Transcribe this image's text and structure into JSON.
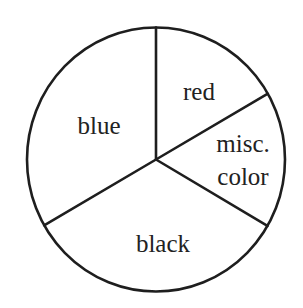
{
  "chart_data": {
    "type": "pie",
    "title": "",
    "start_angle_deg": 90,
    "direction": "clockwise",
    "categories": [
      "red",
      "misc. color",
      "black",
      "blue"
    ],
    "values": [
      16.7,
      16.7,
      33.3,
      33.3
    ],
    "angles_deg": [
      60,
      60,
      120,
      120
    ],
    "legend": "none (labels drawn inside slices)",
    "fill_colors": [
      "#ffffff",
      "#ffffff",
      "#ffffff",
      "#ffffff"
    ],
    "outline_color": "#1e1e1e",
    "labels": [
      {
        "lines": [
          "red"
        ]
      },
      {
        "lines": [
          "misc.",
          "color"
        ]
      },
      {
        "lines": [
          "black"
        ]
      },
      {
        "lines": [
          "blue"
        ]
      }
    ]
  }
}
